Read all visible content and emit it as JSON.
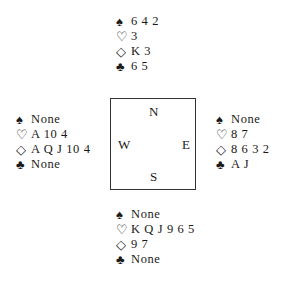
{
  "suit_symbols": {
    "spades": "♠",
    "hearts": "♡",
    "diamonds": "◇",
    "clubs": "♣"
  },
  "compass": {
    "north": "N",
    "south": "S",
    "west": "W",
    "east": "E"
  },
  "hands": {
    "north": {
      "spades": "6 4 2",
      "hearts": "3",
      "diamonds": "K 3",
      "clubs": "6 5"
    },
    "west": {
      "spades": "None",
      "hearts": "A 10 4",
      "diamonds": "A Q J 10 4",
      "clubs": "None"
    },
    "east": {
      "spades": "None",
      "hearts": "8 7",
      "diamonds": "8 6 3 2",
      "clubs": "A J"
    },
    "south": {
      "spades": "None",
      "hearts": "K Q J 9 6 5",
      "diamonds": "9 7",
      "clubs": "None"
    }
  }
}
